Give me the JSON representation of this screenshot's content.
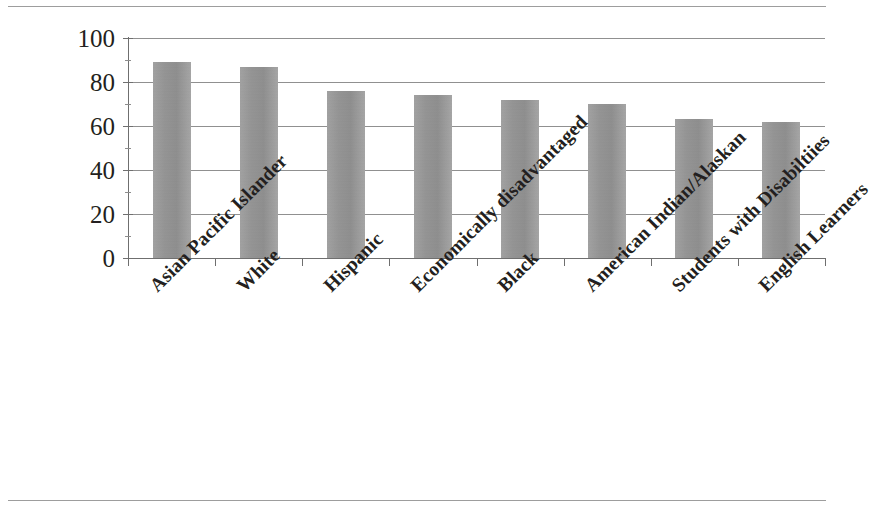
{
  "figure": {
    "background_color": "#ffffff",
    "rule_color": "#8c8c8c",
    "has_top_rule": true,
    "has_bottom_rule": true
  },
  "axis": {
    "y_ticks": [
      "0",
      "20",
      "40",
      "60",
      "80",
      "100"
    ],
    "tick_color": "#6f6f6f",
    "gridline_color": "#8a8a8a",
    "label_color": "#231f20"
  },
  "bars": {
    "fill_color": "#989898",
    "edge_color": "#8e8e8e"
  },
  "chart_data": {
    "type": "bar",
    "title": "",
    "subtitle": "",
    "xlabel": "",
    "ylabel": "",
    "ylim": [
      0,
      100
    ],
    "yticks": [
      0,
      20,
      40,
      60,
      80,
      100
    ],
    "grid": true,
    "legend": false,
    "legend_position": "none",
    "orientation": "vertical",
    "categories": [
      "Asian Pacific Islander",
      "White",
      "Hispanic",
      "Economically disadvantaged",
      "Black",
      "American Indian/Alaskan",
      "Students with Disabiltiies",
      "English Learners"
    ],
    "values": [
      89,
      87,
      76,
      74,
      72,
      70,
      63,
      62
    ],
    "series": [
      {
        "name": "",
        "values": [
          89,
          87,
          76,
          74,
          72,
          70,
          63,
          62
        ],
        "color": "#989898"
      }
    ],
    "annotations": []
  }
}
